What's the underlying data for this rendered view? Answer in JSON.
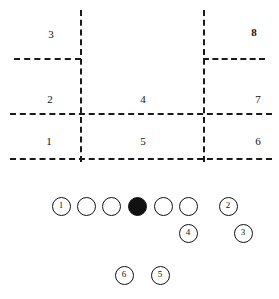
{
  "diagram": {
    "colors": {
      "ink": "#111111",
      "background": "#ffffff"
    },
    "zone_grid": {
      "lines": [
        {
          "name": "left-vertical-divider",
          "orientation": "vertical",
          "x": 80,
          "y1": 10,
          "y2": 162
        },
        {
          "name": "right-vertical-divider",
          "orientation": "vertical",
          "x": 203,
          "y1": 10,
          "y2": 162
        },
        {
          "name": "upper-left-horizontal-divider",
          "orientation": "horizontal",
          "y": 58,
          "x1": 14,
          "x2": 81
        },
        {
          "name": "upper-right-horizontal-divider",
          "orientation": "horizontal",
          "y": 58,
          "x1": 203,
          "x2": 265
        },
        {
          "name": "middle-horizontal-divider",
          "orientation": "horizontal",
          "y": 113,
          "x1": 10,
          "x2": 272
        },
        {
          "name": "bottom-horizontal-divider",
          "orientation": "horizontal",
          "y": 158,
          "x1": 10,
          "x2": 272
        }
      ],
      "labels": [
        {
          "name": "zone-label-3",
          "text": "3",
          "x": 51,
          "y": 29,
          "bold": false
        },
        {
          "name": "zone-label-8",
          "text": "8",
          "x": 254,
          "y": 27,
          "bold": true
        },
        {
          "name": "zone-label-2",
          "text": "2",
          "x": 50,
          "y": 94,
          "bold": false
        },
        {
          "name": "zone-label-4",
          "text": "4",
          "x": 143,
          "y": 94,
          "bold": false
        },
        {
          "name": "zone-label-7",
          "text": "7",
          "x": 258,
          "y": 94,
          "bold": false
        },
        {
          "name": "zone-label-1",
          "text": "1",
          "x": 49,
          "y": 136,
          "bold": false
        },
        {
          "name": "zone-label-5",
          "text": "5",
          "x": 143,
          "y": 136,
          "bold": false
        },
        {
          "name": "zone-label-6",
          "text": "6",
          "x": 258,
          "y": 136,
          "bold": false
        }
      ]
    },
    "players": [
      {
        "name": "player-1",
        "label": "1",
        "x": 61,
        "y": 206,
        "filled": false
      },
      {
        "name": "player-unlabeled-left-2",
        "label": "",
        "x": 86,
        "y": 206,
        "filled": false
      },
      {
        "name": "player-unlabeled-left-1",
        "label": "",
        "x": 111,
        "y": 206,
        "filled": false
      },
      {
        "name": "player-center-ball",
        "label": "",
        "x": 137,
        "y": 206,
        "filled": true
      },
      {
        "name": "player-unlabeled-right-1",
        "label": "",
        "x": 163,
        "y": 206,
        "filled": false
      },
      {
        "name": "player-unlabeled-right-2",
        "label": "",
        "x": 188,
        "y": 206,
        "filled": false
      },
      {
        "name": "player-2",
        "label": "2",
        "x": 228,
        "y": 206,
        "filled": false
      },
      {
        "name": "player-4",
        "label": "4",
        "x": 188,
        "y": 233,
        "filled": false
      },
      {
        "name": "player-3",
        "label": "3",
        "x": 243,
        "y": 233,
        "filled": false
      },
      {
        "name": "player-6",
        "label": "6",
        "x": 124,
        "y": 275,
        "filled": false
      },
      {
        "name": "player-5",
        "label": "5",
        "x": 160,
        "y": 275,
        "filled": false
      }
    ]
  }
}
